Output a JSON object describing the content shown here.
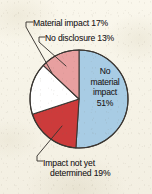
{
  "figure": {
    "background_color": "#f7f4e9",
    "text_color": "#23201c",
    "outline_color": "#3a3632"
  },
  "chart_data": {
    "type": "pie",
    "title": "",
    "subtitle": "",
    "xlabel": "",
    "ylabel": "",
    "grid": false,
    "legend_position": "none",
    "label_style": "callout-leader-lines",
    "start_angle_deg": 0,
    "direction": "clockwise",
    "units": "percent",
    "total": 100,
    "categories": [
      "No material impact",
      "Impact not yet determined",
      "Material impact",
      "No disclosure"
    ],
    "values": [
      51,
      19,
      17,
      13
    ],
    "colors": [
      "#a8cce4",
      "#cc3b3b",
      "#ffffff",
      "#e8a0a0"
    ],
    "slices": [
      {
        "name": "No material impact",
        "value": 51,
        "value_label": "51%",
        "color": "#a8cce4",
        "label_placement": "inside"
      },
      {
        "name": "Impact not yet determined",
        "value": 19,
        "value_label": "19%",
        "color": "#cc3b3b",
        "label_placement": "callout-bottom-left"
      },
      {
        "name": "Material impact",
        "value": 17,
        "value_label": "17%",
        "color": "#ffffff",
        "label_placement": "callout-top-left"
      },
      {
        "name": "No disclosure",
        "value": 13,
        "value_label": "13%",
        "color": "#e8a0a0",
        "label_placement": "callout-top"
      }
    ]
  },
  "labels": {
    "material_impact": "Material impact 17%",
    "no_disclosure": "No disclosure 13%",
    "impact_not_yet_line1": "Impact not yet",
    "impact_not_yet_line2": "determined 19%",
    "center_line1": "No",
    "center_line2": "material",
    "center_line3": "impact",
    "center_line4": "51%"
  }
}
